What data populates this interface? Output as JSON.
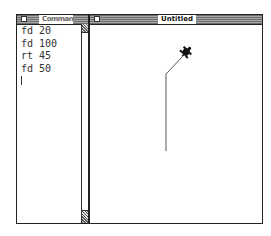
{
  "command_window": {
    "title": "Commands",
    "lines": [
      "fd 20",
      "fd 100",
      "rt 45",
      "fd 50"
    ]
  },
  "graphics_window": {
    "title": "Untitled",
    "turtle_path": [
      [
        166,
        151
      ],
      [
        166,
        74
      ],
      [
        184,
        55
      ]
    ],
    "turtle_position": [
      186,
      52
    ]
  }
}
